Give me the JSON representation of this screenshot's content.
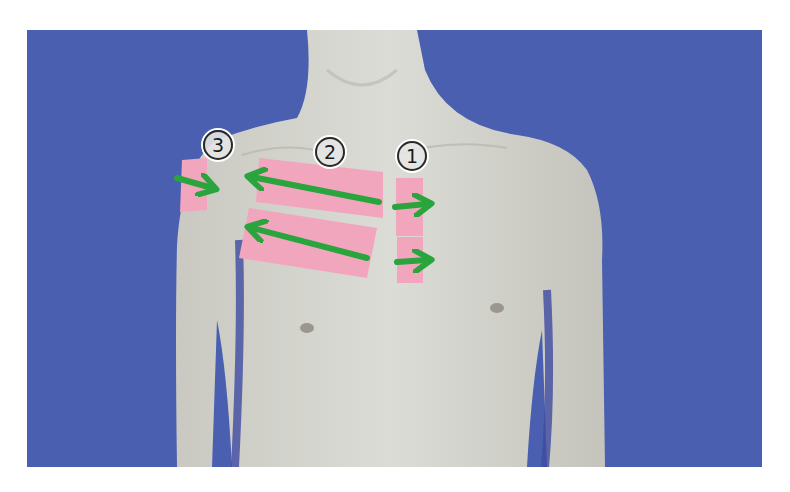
{
  "figure": {
    "background_color": "#4a5fb0",
    "skin_color": "#d8d8d2",
    "tape_color": "#f2a6be",
    "arrow_color": "#2aa43c"
  },
  "labels": [
    {
      "id": "label-1",
      "text": "①",
      "number": "1"
    },
    {
      "id": "label-2",
      "text": "②",
      "number": "2"
    },
    {
      "id": "label-3",
      "text": "③",
      "number": "3"
    }
  ],
  "tape_strips": [
    {
      "group": "1",
      "name": "tape-strip-1-upper"
    },
    {
      "group": "1",
      "name": "tape-strip-1-lower"
    },
    {
      "group": "2",
      "name": "tape-strip-2-upper"
    },
    {
      "group": "2",
      "name": "tape-strip-2-lower"
    },
    {
      "group": "3",
      "name": "tape-strip-3"
    }
  ],
  "arrows": [
    {
      "group": "1",
      "direction": "right"
    },
    {
      "group": "1",
      "direction": "right"
    },
    {
      "group": "2",
      "direction": "left"
    },
    {
      "group": "2",
      "direction": "left"
    },
    {
      "group": "3",
      "direction": "right-down"
    }
  ]
}
